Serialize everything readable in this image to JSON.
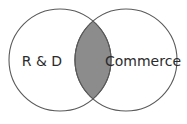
{
  "diagram": {
    "type": "venn",
    "sets": [
      {
        "id": "left",
        "label": "R & D"
      },
      {
        "id": "right",
        "label": "Commerce"
      }
    ],
    "intersection": {
      "sets": [
        "left",
        "right"
      ],
      "highlighted": true
    },
    "colors": {
      "intersection_fill": "#8c8c8c",
      "circle_fill": "#ffffff",
      "outline": "#5a5a5a",
      "text": "#2b2b2b"
    }
  }
}
